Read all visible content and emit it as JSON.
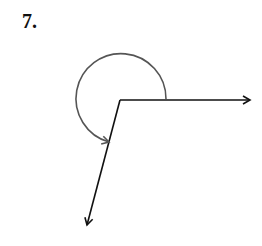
{
  "problem": {
    "number": "7."
  },
  "diagram": {
    "vertex": [
      120,
      100
    ],
    "ray1_end": [
      252,
      100
    ],
    "ray2_end": [
      87,
      226
    ],
    "arc": {
      "center": [
        121,
        99
      ],
      "radius": 45,
      "direction": "counterclockwise",
      "from": "ray1",
      "to": "ray2",
      "description": "reflex angle"
    },
    "stroke_color": "#111111",
    "arc_color": "#555555"
  }
}
